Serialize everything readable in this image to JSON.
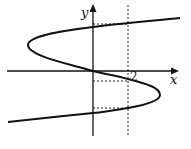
{
  "diagram": {
    "type": "function-graph",
    "axes": {
      "x_label": "x",
      "y_label": "y",
      "x_tick_label": "2"
    },
    "curve": {
      "description": "S-shaped cubic curve (x as a function of y) passing through the origin",
      "stroke": "#111111"
    },
    "guides": {
      "vertical_line": "x = 2 (dashed)",
      "horizontal_dashed_segments": 3
    },
    "colors": {
      "ink": "#111111",
      "background": "#ffffff"
    }
  }
}
